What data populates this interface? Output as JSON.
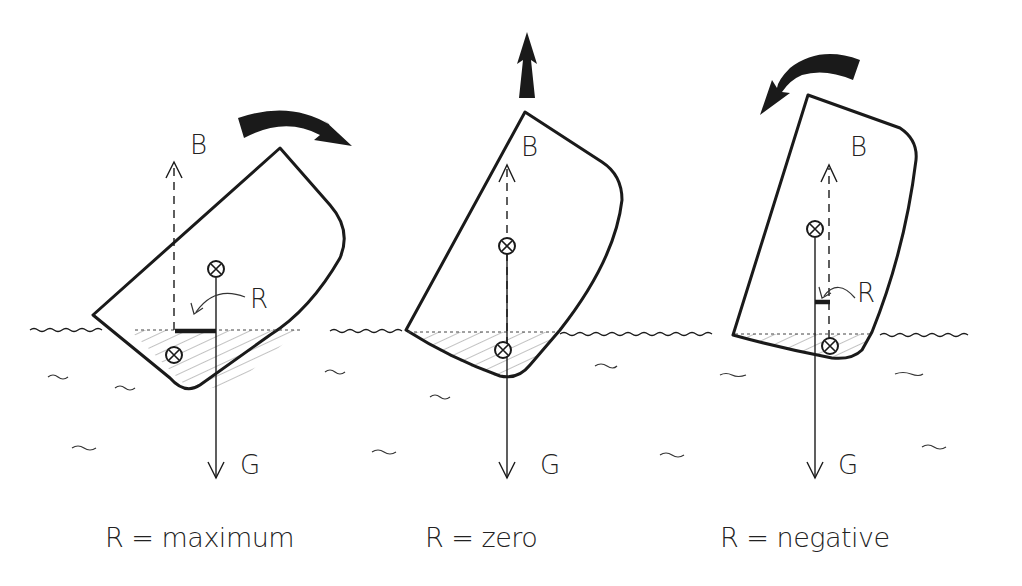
{
  "diagram": {
    "colors": {
      "ink": "#1a1a1a",
      "paper": "#ffffff",
      "hatch": "#555555"
    },
    "panels": [
      {
        "id": "max",
        "force_up_label": "B",
        "force_down_label": "G",
        "lever_label": "R",
        "caption": "R = maximum",
        "rotation": "clockwise"
      },
      {
        "id": "zero",
        "force_up_label": "B",
        "force_down_label": "G",
        "caption": "R = zero",
        "rotation": "up"
      },
      {
        "id": "negative",
        "force_up_label": "B",
        "force_down_label": "G",
        "lever_label": "R",
        "caption": "R = negative",
        "rotation": "counterclockwise"
      }
    ],
    "icons": [
      "curved-arrow-clockwise-icon",
      "up-arrow-icon",
      "curved-arrow-counterclockwise-icon",
      "center-of-mass-icon"
    ]
  }
}
